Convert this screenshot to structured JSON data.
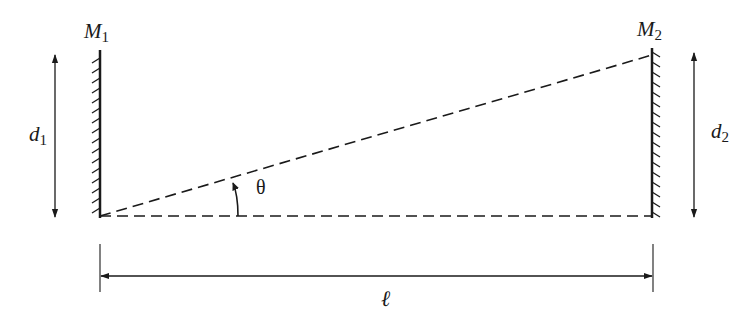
{
  "diagram": {
    "labels": {
      "mirror1": "M",
      "mirror1_sub": "1",
      "mirror2": "M",
      "mirror2_sub": "2",
      "d1": "d",
      "d1_sub": "1",
      "d2": "d",
      "d2_sub": "2",
      "angle": "θ",
      "length": "ℓ"
    },
    "colors": {
      "ink": "#1a1a1a",
      "background": "#ffffff"
    }
  }
}
